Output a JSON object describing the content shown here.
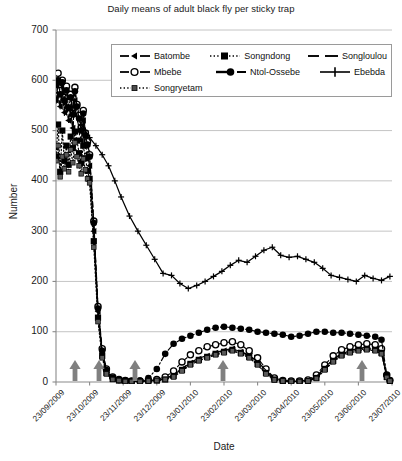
{
  "chart_data": {
    "type": "line",
    "title": "Daily means of adult black fly per sticky trap",
    "xlabel": "Date",
    "ylabel": "Number",
    "ylim": [
      0,
      700
    ],
    "yticks": [
      0,
      100,
      200,
      300,
      400,
      500,
      600,
      700
    ],
    "grid": true,
    "legend_position": "top-center",
    "xtick_labels": [
      "23/09/2009",
      "23/10/2009",
      "23/11/2009",
      "23/12/2009",
      "23/01/2010",
      "23/02/2010",
      "23/03/2010",
      "23/04/2010",
      "23/05/2010",
      "23/06/2010",
      "23/07/2010"
    ],
    "annotations": {
      "arrow_label": "larviciding treatment",
      "arrow_dates": [
        "23/09/2009",
        "15/10/2009",
        "28/11/2009",
        "05/03/2010",
        "10/07/2010"
      ]
    },
    "series": [
      {
        "name": "Batombe",
        "marker": "tri-left",
        "dash": "dash",
        "x": [
          0,
          2,
          4,
          6,
          8,
          10,
          12,
          14,
          16,
          18,
          20,
          22,
          24,
          26,
          28,
          30,
          32,
          36,
          40,
          44,
          48,
          54,
          60,
          66,
          72,
          80,
          88,
          96,
          104,
          112,
          120,
          128,
          136,
          144,
          152,
          160,
          168,
          176,
          184,
          192,
          200,
          208,
          216,
          224,
          232,
          240,
          248,
          256,
          264,
          272,
          280,
          288,
          296,
          304,
          310,
          315,
          318
        ],
        "y": [
          560,
          575,
          548,
          590,
          536,
          568,
          520,
          545,
          505,
          560,
          530,
          500,
          480,
          520,
          470,
          455,
          430,
          300,
          140,
          60,
          22,
          8,
          4,
          2,
          1,
          1,
          2,
          3,
          6,
          14,
          26,
          38,
          46,
          52,
          58,
          62,
          66,
          60,
          52,
          40,
          22,
          6,
          2,
          1,
          1,
          2,
          10,
          28,
          44,
          56,
          62,
          66,
          68,
          66,
          60,
          12,
          2
        ]
      },
      {
        "name": "Mbebe",
        "marker": "circle-open",
        "dash": "dash",
        "x": [
          0,
          2,
          4,
          6,
          8,
          10,
          12,
          14,
          16,
          18,
          20,
          22,
          24,
          26,
          28,
          30,
          32,
          36,
          40,
          44,
          48,
          54,
          60,
          66,
          72,
          80,
          88,
          96,
          104,
          112,
          120,
          128,
          136,
          144,
          152,
          160,
          168,
          176,
          184,
          192,
          200,
          208,
          216,
          224,
          232,
          240,
          248,
          256,
          264,
          272,
          280,
          288,
          296,
          304,
          310,
          315,
          318
        ],
        "y": [
          596,
          614,
          580,
          600,
          566,
          588,
          556,
          572,
          540,
          586,
          552,
          530,
          505,
          540,
          495,
          478,
          452,
          320,
          150,
          66,
          26,
          10,
          5,
          3,
          2,
          2,
          3,
          5,
          10,
          22,
          40,
          54,
          62,
          70,
          74,
          78,
          80,
          74,
          62,
          48,
          26,
          8,
          3,
          2,
          2,
          4,
          14,
          34,
          52,
          64,
          70,
          74,
          76,
          74,
          66,
          14,
          3
        ]
      },
      {
        "name": "Songndong",
        "marker": "square-filled",
        "dash": "dotted",
        "x": [
          0,
          2,
          4,
          6,
          8,
          10,
          12,
          14,
          16,
          18,
          20,
          22,
          24,
          26,
          28,
          30,
          32,
          36,
          40,
          44,
          48,
          54,
          60,
          66,
          72,
          80,
          88,
          96,
          104,
          112,
          120,
          128,
          136,
          144,
          152,
          160,
          168,
          176,
          184,
          192,
          200,
          208,
          216,
          224,
          232,
          240,
          248,
          256,
          264,
          272,
          280,
          288,
          296,
          304,
          310,
          315,
          318
        ],
        "y": [
          448,
          512,
          418,
          500,
          440,
          470,
          432,
          488,
          465,
          498,
          480,
          455,
          436,
          470,
          445,
          420,
          404,
          280,
          128,
          52,
          18,
          6,
          3,
          2,
          1,
          1,
          2,
          3,
          5,
          12,
          24,
          36,
          44,
          50,
          56,
          60,
          64,
          58,
          50,
          36,
          18,
          5,
          2,
          1,
          1,
          2,
          8,
          26,
          42,
          54,
          60,
          64,
          66,
          64,
          58,
          10,
          2
        ]
      },
      {
        "name": "Ntol-Ossebe",
        "marker": "circle-filled",
        "dash": "dashdot",
        "x": [
          0,
          2,
          4,
          6,
          8,
          10,
          12,
          14,
          16,
          18,
          20,
          22,
          24,
          26,
          28,
          30,
          32,
          36,
          40,
          44,
          48,
          54,
          60,
          66,
          72,
          80,
          88,
          96,
          104,
          112,
          120,
          128,
          136,
          144,
          152,
          160,
          168,
          176,
          184,
          192,
          200,
          208,
          216,
          224,
          232,
          240,
          248,
          256,
          264,
          272,
          280,
          288,
          296,
          304,
          310,
          315,
          318
        ],
        "y": [
          590,
          600,
          572,
          596,
          560,
          580,
          545,
          566,
          532,
          578,
          548,
          524,
          500,
          534,
          490,
          472,
          448,
          316,
          146,
          62,
          24,
          9,
          4,
          3,
          2,
          3,
          8,
          26,
          56,
          76,
          86,
          92,
          98,
          104,
          108,
          110,
          108,
          106,
          104,
          100,
          98,
          96,
          94,
          90,
          92,
          96,
          100,
          100,
          98,
          98,
          96,
          94,
          92,
          90,
          84,
          14,
          3
        ]
      },
      {
        "name": "Songloulou",
        "marker": "none",
        "dash": "longdash",
        "x": [
          0,
          2,
          4,
          6,
          8,
          10,
          12,
          14,
          16,
          18,
          20,
          22,
          24,
          26,
          28,
          30,
          32,
          36,
          40,
          44,
          48,
          54,
          60,
          66,
          72,
          80,
          88,
          96,
          104,
          112,
          120,
          128,
          136,
          144,
          152,
          160,
          168,
          176,
          184,
          192,
          200,
          208,
          216,
          224,
          232,
          240,
          248,
          256,
          264,
          272,
          280,
          288,
          296,
          304,
          310,
          315,
          318
        ],
        "y": [
          554,
          570,
          542,
          584,
          530,
          562,
          516,
          540,
          500,
          556,
          526,
          496,
          476,
          514,
          466,
          450,
          426,
          296,
          138,
          58,
          20,
          7,
          4,
          2,
          1,
          1,
          2,
          3,
          6,
          15,
          27,
          39,
          47,
          53,
          59,
          63,
          67,
          61,
          53,
          41,
          23,
          7,
          2,
          1,
          1,
          2,
          11,
          29,
          45,
          57,
          63,
          67,
          69,
          67,
          61,
          12,
          2
        ]
      },
      {
        "name": "Ebebda",
        "marker": "plus",
        "dash": "solid",
        "x": [
          0,
          4,
          8,
          12,
          16,
          20,
          24,
          28,
          32,
          38,
          44,
          50,
          56,
          62,
          70,
          78,
          86,
          94,
          102,
          110,
          118,
          126,
          134,
          142,
          150,
          158,
          166,
          174,
          182,
          190,
          198,
          206,
          214,
          222,
          230,
          238,
          246,
          254,
          262,
          270,
          278,
          286,
          294,
          302,
          310,
          318
        ],
        "y": [
          565,
          572,
          556,
          548,
          540,
          528,
          512,
          500,
          486,
          470,
          452,
          430,
          400,
          368,
          330,
          300,
          272,
          244,
          216,
          212,
          196,
          186,
          192,
          200,
          210,
          220,
          232,
          242,
          238,
          250,
          262,
          268,
          252,
          248,
          250,
          244,
          238,
          226,
          212,
          208,
          204,
          200,
          212,
          206,
          202,
          210
        ]
      },
      {
        "name": "Songryetam",
        "marker": "square-small",
        "dash": "dotted",
        "x": [
          0,
          2,
          4,
          6,
          8,
          10,
          12,
          14,
          16,
          18,
          20,
          22,
          24,
          26,
          28,
          30,
          32,
          36,
          40,
          44,
          48,
          54,
          60,
          66,
          72,
          80,
          88,
          96,
          104,
          112,
          120,
          128,
          136,
          144,
          152,
          160,
          168,
          176,
          184,
          192,
          200,
          208,
          216,
          224,
          232,
          240,
          248,
          256,
          264,
          272,
          280,
          288,
          296,
          304,
          310,
          315,
          318
        ],
        "y": [
          440,
          470,
          408,
          448,
          424,
          452,
          418,
          462,
          436,
          476,
          448,
          430,
          414,
          444,
          422,
          404,
          396,
          268,
          120,
          48,
          16,
          5,
          3,
          1,
          1,
          1,
          2,
          3,
          5,
          10,
          22,
          34,
          42,
          48,
          54,
          58,
          62,
          56,
          48,
          34,
          16,
          4,
          2,
          1,
          1,
          2,
          7,
          24,
          40,
          52,
          58,
          62,
          64,
          62,
          56,
          9,
          2
        ]
      }
    ]
  },
  "legend": {
    "rows": [
      [
        {
          "label": "Batombe",
          "key": "dash-tri-left"
        },
        {
          "label": "Songndong",
          "key": "dot-square-filled"
        },
        {
          "label": "Songloulou",
          "key": "longdash"
        }
      ],
      [
        {
          "label": "Mbebe",
          "key": "dash-circle-open"
        },
        {
          "label": "Ntol-Ossebe",
          "key": "dashdot-circle-filled"
        },
        {
          "label": "Ebebda",
          "key": "solid-plus"
        }
      ],
      [
        {
          "label": "Songryetam",
          "key": "dot-square-small"
        }
      ]
    ]
  },
  "colors": {
    "line": "#000000",
    "grid": "#b5b5b5",
    "axis": "#8a8a8a",
    "arrow": "#808080",
    "background": "#ffffff"
  }
}
